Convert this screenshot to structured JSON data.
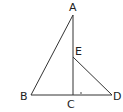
{
  "figure": {
    "type": "geometry-diagram",
    "points": {
      "A": {
        "label": "A",
        "x": 73,
        "y": 15,
        "lx": 69,
        "ly": 11
      },
      "B": {
        "label": "B",
        "x": 31,
        "y": 95,
        "lx": 20,
        "ly": 100
      },
      "C": {
        "label": "C",
        "x": 73,
        "y": 95,
        "lx": 67,
        "ly": 108
      },
      "D": {
        "label": "D",
        "x": 112,
        "y": 95,
        "lx": 113,
        "ly": 100
      },
      "E": {
        "label": "E",
        "x": 73,
        "y": 57,
        "lx": 75,
        "ly": 55
      }
    },
    "segments": [
      "AB",
      "AC",
      "BD",
      "ED"
    ],
    "stroke_color": "#333333"
  }
}
